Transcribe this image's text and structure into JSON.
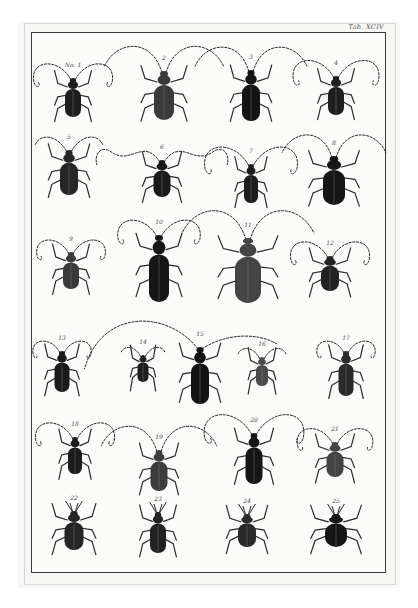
{
  "plate": {
    "title": "Tab. XCIV",
    "colors": {
      "paper": "#f7f7f5",
      "ink": "#1c1c1c",
      "frame": "#3a3a3a"
    }
  },
  "specimens": [
    {
      "num": "No. 1",
      "x": 73,
      "y": 97,
      "len": 40,
      "wid": 16,
      "shade": "#1e1e1e",
      "ant": "curl",
      "antSpan": 46
    },
    {
      "num": "2",
      "x": 164,
      "y": 95,
      "len": 50,
      "wid": 20,
      "shade": "#3a3a3a",
      "ant": "long",
      "antSpan": 60
    },
    {
      "num": "3",
      "x": 251,
      "y": 95,
      "len": 52,
      "wid": 18,
      "shade": "#141414",
      "ant": "long",
      "antSpan": 56
    },
    {
      "num": "4",
      "x": 336,
      "y": 95,
      "len": 40,
      "wid": 16,
      "shade": "#1e1e1e",
      "ant": "curl",
      "antSpan": 50
    },
    {
      "num": "5",
      "x": 69,
      "y": 172,
      "len": 46,
      "wid": 18,
      "shade": "#262626",
      "ant": "short",
      "antSpan": 34
    },
    {
      "num": "6",
      "x": 162,
      "y": 178,
      "len": 38,
      "wid": 17,
      "shade": "#1a1a1a",
      "ant": "wavy",
      "antSpan": 62
    },
    {
      "num": "7",
      "x": 251,
      "y": 183,
      "len": 40,
      "wid": 14,
      "shade": "#1e1e1e",
      "ant": "curl",
      "antSpan": 54
    },
    {
      "num": "8",
      "x": 334,
      "y": 180,
      "len": 50,
      "wid": 22,
      "shade": "#151515",
      "ant": "long",
      "antSpan": 52
    },
    {
      "num": "9",
      "x": 71,
      "y": 270,
      "len": 38,
      "wid": 16,
      "shade": "#3a3a3a",
      "ant": "curl",
      "antSpan": 40
    },
    {
      "num": "10",
      "x": 159,
      "y": 268,
      "len": 68,
      "wid": 20,
      "shade": "#161616",
      "ant": "curl",
      "antSpan": 48
    },
    {
      "num": "11",
      "x": 248,
      "y": 270,
      "len": 66,
      "wid": 26,
      "shade": "#444444",
      "ant": "long",
      "antSpan": 66
    },
    {
      "num": "12",
      "x": 330,
      "y": 273,
      "len": 36,
      "wid": 18,
      "shade": "#222222",
      "ant": "curl",
      "antSpan": 46
    },
    {
      "num": "13",
      "x": 62,
      "y": 371,
      "len": 42,
      "wid": 15,
      "shade": "#1a1a1a",
      "ant": "curl",
      "antSpan": 34
    },
    {
      "num": "14",
      "x": 143,
      "y": 368,
      "len": 28,
      "wid": 11,
      "shade": "#1e1e1e",
      "ant": "short",
      "antSpan": 22
    },
    {
      "num": "15",
      "x": 200,
      "y": 375,
      "len": 58,
      "wid": 18,
      "shade": "#121212",
      "ant": "arch",
      "antSpan": 110
    },
    {
      "num": "16",
      "x": 262,
      "y": 371,
      "len": 30,
      "wid": 12,
      "shade": "#4a4a4a",
      "ant": "short",
      "antSpan": 24
    },
    {
      "num": "17",
      "x": 346,
      "y": 373,
      "len": 46,
      "wid": 15,
      "shade": "#2a2a2a",
      "ant": "curl",
      "antSpan": 34
    },
    {
      "num": "18",
      "x": 75,
      "y": 455,
      "len": 38,
      "wid": 14,
      "shade": "#1c1c1c",
      "ant": "curl",
      "antSpan": 46
    },
    {
      "num": "19",
      "x": 159,
      "y": 470,
      "len": 42,
      "wid": 17,
      "shade": "#3c3c3c",
      "ant": "long",
      "antSpan": 58
    },
    {
      "num": "20",
      "x": 254,
      "y": 458,
      "len": 52,
      "wid": 17,
      "shade": "#161616",
      "ant": "curl",
      "antSpan": 58
    },
    {
      "num": "21",
      "x": 335,
      "y": 459,
      "len": 36,
      "wid": 17,
      "shade": "#444444",
      "ant": "curl",
      "antSpan": 44
    },
    {
      "num": "22",
      "x": 74,
      "y": 530,
      "len": 40,
      "wid": 19,
      "shade": "#252525",
      "ant": "weevil",
      "antSpan": 14
    },
    {
      "num": "23",
      "x": 158,
      "y": 532,
      "len": 42,
      "wid": 16,
      "shade": "#222222",
      "ant": "weevil",
      "antSpan": 14
    },
    {
      "num": "24",
      "x": 247,
      "y": 530,
      "len": 34,
      "wid": 18,
      "shade": "#2a2a2a",
      "ant": "weevil",
      "antSpan": 14
    },
    {
      "num": "25",
      "x": 336,
      "y": 530,
      "len": 34,
      "wid": 22,
      "shade": "#161616",
      "ant": "weevil",
      "antSpan": 14
    }
  ]
}
